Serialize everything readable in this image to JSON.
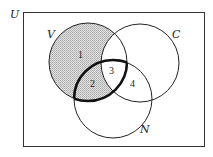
{
  "diagram": {
    "type": "venn",
    "universe_label": "U",
    "sets": [
      {
        "id": "V",
        "label": "V"
      },
      {
        "id": "C",
        "label": "C"
      },
      {
        "id": "N",
        "label": "N"
      }
    ],
    "regions": [
      {
        "label": "1",
        "description": "V only"
      },
      {
        "label": "2",
        "description": "V and N, not C"
      },
      {
        "label": "3",
        "description": "V, C and N"
      },
      {
        "label": "4",
        "description": "C and N, not V"
      }
    ],
    "shaded": "V minus C (regions 1 and 2)",
    "bold_outline": "V intersect N (regions 2 and 3)",
    "colors": {
      "stroke": "#222222",
      "shade": "#c8c8c8",
      "background": "#ffffff"
    }
  }
}
